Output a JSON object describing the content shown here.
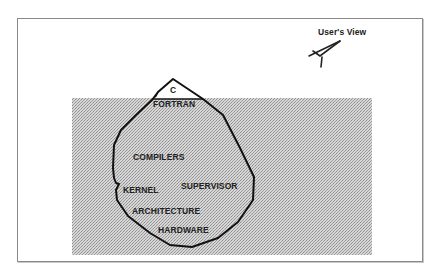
{
  "diagram": {
    "viewer": {
      "label": "User's View",
      "icon": "eye-icon"
    },
    "iceberg": {
      "tip_label": "C",
      "layers": [
        {
          "label": "FORTRAN"
        },
        {
          "label": "COMPILERS"
        },
        {
          "label": "KERNEL"
        },
        {
          "label": "SUPERVISOR"
        },
        {
          "label": "ARCHITECTURE"
        },
        {
          "label": "HARDWARE"
        }
      ]
    },
    "colors": {
      "water": "#c4c4c4",
      "outline": "#111111",
      "frame": "#8a8a8a"
    }
  }
}
